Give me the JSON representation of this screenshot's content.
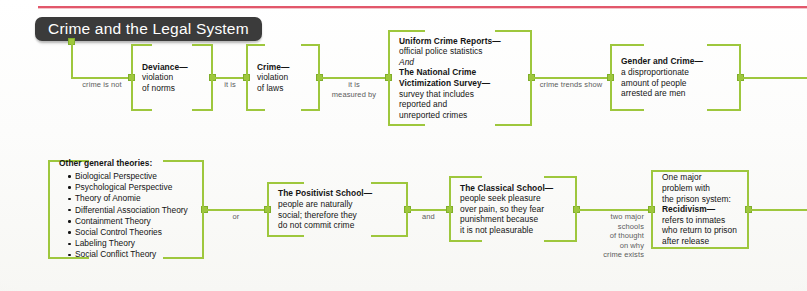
{
  "page": {
    "title_chip": "Crime and the Legal System",
    "accent_green": "#9ec73d",
    "rule_red": "#e2576b",
    "chip_dark": "#3b3b3b",
    "background": "#fbfbfb"
  },
  "diagram": {
    "type": "concept-map",
    "rows": [
      {
        "id": "row-top",
        "nodes": [
          {
            "id": "deviance",
            "title": "Deviance—",
            "lines": [
              "violation",
              "of norms"
            ]
          },
          {
            "id": "crime",
            "title": "Crime—",
            "lines": [
              "violation",
              "of laws"
            ]
          },
          {
            "id": "measures",
            "title": "Uniform Crime Reports—",
            "lines": [
              "official police statistics",
              "And",
              "The National Crime",
              "Victimization Survey—",
              "survey that includes",
              "reported and",
              "unreported crimes"
            ]
          },
          {
            "id": "gender",
            "title": "Gender and Crime—",
            "lines": [
              "a disproportionate",
              "amount of people",
              "arrested are men"
            ]
          }
        ],
        "connectors": [
          {
            "id": "c1",
            "label": "crime is not"
          },
          {
            "id": "c2",
            "label": "it is"
          },
          {
            "id": "c3",
            "label": "it is\nmeasured by"
          },
          {
            "id": "c4",
            "label": "crime trends show"
          }
        ]
      },
      {
        "id": "row-bottom",
        "nodes": [
          {
            "id": "other-theories",
            "title": "Other general theories:",
            "bullets": [
              "Biological Perspective",
              "Psychological Perspective",
              "Theory of Anomie",
              "Differential Association Theory",
              "Containment Theory",
              "Social Control Theories",
              "Labeling Theory",
              "Social Conflict Theory"
            ]
          },
          {
            "id": "positivist",
            "title": "The Positivist School—",
            "lines": [
              "people are naturally",
              "social; therefore they",
              "do not commit crime"
            ]
          },
          {
            "id": "classical",
            "title": "The Classical School—",
            "lines": [
              "people seek pleasure",
              "over pain, so they fear",
              "punishment because",
              "it is not pleasurable"
            ]
          },
          {
            "id": "recidivism",
            "lead": [
              "One major",
              "problem with",
              "the prison system:"
            ],
            "title": "Recidivism—",
            "lines": [
              "refers to inmates",
              "who return to prison",
              "after release"
            ]
          }
        ],
        "connectors": [
          {
            "id": "c5",
            "label": "or"
          },
          {
            "id": "c6",
            "label": "and"
          },
          {
            "id": "c7",
            "label": "two major\nschools\nof thought\non why\ncrime exists"
          }
        ]
      }
    ]
  }
}
